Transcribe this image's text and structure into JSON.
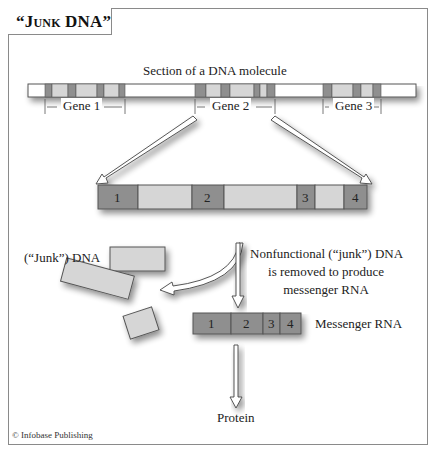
{
  "title": "“Junk DNA”",
  "dna_molecule": {
    "label": "Section of a DNA molecule",
    "genes": [
      {
        "label": "Gene 1"
      },
      {
        "label": "Gene 2"
      },
      {
        "label": "Gene 3"
      }
    ]
  },
  "gene_expanded": {
    "exons": [
      "1",
      "2",
      "3",
      "4"
    ]
  },
  "junk_dna": {
    "label": "(“Junk”) DNA"
  },
  "process_note": {
    "lines": [
      "Nonfunctional (“junk”) DNA",
      "is removed to produce",
      "messenger RNA"
    ]
  },
  "mrna": {
    "label": "Messenger RNA",
    "segments": [
      "1",
      "2",
      "3",
      "4"
    ]
  },
  "protein": {
    "label": "Protein"
  },
  "credit": "© Infobase Publishing",
  "colors": {
    "exon": "#8f8f8f",
    "intron": "#d6d6d6",
    "spacer": "#ffffff",
    "border": "#555555",
    "frame": "#8a8a8a"
  }
}
